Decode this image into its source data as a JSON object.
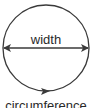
{
  "diagram": {
    "width_label": "width",
    "circumference_label": "circumference",
    "stroke_color": "#3a3a3a",
    "text_color": "#2a2a2a"
  }
}
